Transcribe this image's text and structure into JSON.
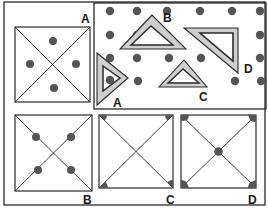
{
  "figure": {
    "colors": {
      "line": "#2a2a2a",
      "dot": "#555555",
      "triangle_fill": "#cfcfcf",
      "background": "#ffffff"
    },
    "panels": {
      "reference_square": {
        "label": "A",
        "description": "Square with diagonals and four dots between the diagonals (top, left, right, bottom)"
      },
      "dot_grid": {
        "description": "Dotted board with four set-square triangles",
        "triangles": [
          {
            "label": "A"
          },
          {
            "label": "B"
          },
          {
            "label": "C"
          },
          {
            "label": "D"
          }
        ]
      },
      "options": [
        {
          "label": "B",
          "description": "Square with diagonals, four dots placed on the diagonals"
        },
        {
          "label": "C",
          "description": "Square with diagonals, shaded wedges at three corners"
        },
        {
          "label": "D",
          "description": "Square with diagonals, shaded wedges at four corners and dot at center"
        }
      ]
    }
  }
}
